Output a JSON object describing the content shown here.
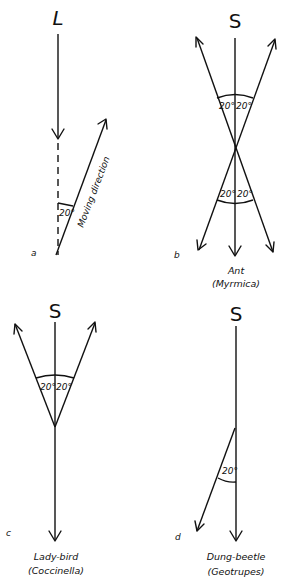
{
  "figure": {
    "panels": [
      {
        "id": "a",
        "panel_label": "a",
        "stimulus_label": "L",
        "angle_labels": [
          "20°"
        ],
        "line_label": "Moving direction",
        "caption_line1": "",
        "caption_line2": ""
      },
      {
        "id": "b",
        "panel_label": "b",
        "stimulus_label": "S",
        "angle_labels": [
          "20°",
          "20°",
          "20°",
          "20°"
        ],
        "caption_line1": "Ant",
        "caption_line2": "(Myrmica)"
      },
      {
        "id": "c",
        "panel_label": "c",
        "stimulus_label": "S",
        "angle_labels": [
          "20°",
          "20°"
        ],
        "caption_line1": "Lady-bird",
        "caption_line2": "(Coccinella)"
      },
      {
        "id": "d",
        "panel_label": "d",
        "stimulus_label": "S",
        "angle_labels": [
          "20°"
        ],
        "caption_line1": "Dung-beetle",
        "caption_line2": "(Geotrupes)"
      }
    ]
  }
}
